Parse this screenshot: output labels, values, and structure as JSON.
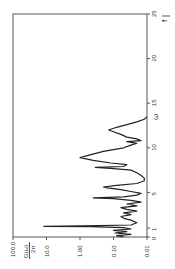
{
  "chart_data": {
    "type": "line",
    "title": "",
    "orientation": "rotated-90-ccw",
    "xlabel": "ω",
    "ylabel": "G(ω)/2π",
    "xscale": "linear",
    "yscale": "log",
    "xlim": [
      0,
      25
    ],
    "ylim": [
      0.01,
      100.0
    ],
    "x_ticks": [
      0,
      1,
      5,
      10,
      15,
      20,
      25
    ],
    "x_tick_labels": [
      "0",
      "1",
      "5",
      "10",
      "15",
      "20",
      "25"
    ],
    "y_ticks": [
      100.0,
      10.0,
      1.0,
      0.1,
      0.01
    ],
    "y_tick_labels": [
      "100.0",
      "10.0",
      "1.00",
      "0.10",
      "0.01"
    ],
    "ylabel_numerator": "G(ω)",
    "ylabel_denominator": "2π",
    "axis_arrow_label": "f",
    "grid": false,
    "legend": null,
    "series": [
      {
        "name": "G(ω)/2π",
        "x": [
          0.0,
          0.15,
          0.3,
          0.45,
          0.6,
          0.75,
          0.9,
          1.05,
          1.15,
          1.2,
          1.25,
          1.35,
          1.6,
          1.9,
          2.1,
          2.3,
          2.5,
          2.7,
          2.9,
          3.1,
          3.3,
          3.5,
          3.7,
          3.9,
          4.1,
          4.3,
          4.4,
          4.5,
          4.7,
          4.9,
          5.1,
          5.3,
          5.5,
          5.6,
          5.8,
          6.0,
          6.3,
          6.6,
          6.9,
          7.2,
          7.5,
          7.7,
          7.8,
          7.9,
          8.1,
          8.3,
          8.6,
          8.9,
          9.2,
          9.6,
          10.0,
          10.3,
          10.5,
          10.7,
          10.8,
          11.0,
          11.2,
          11.5,
          11.8,
          12.0,
          12.3,
          12.6,
          12.9,
          13.2,
          13.5
        ],
        "y": [
          0.05,
          0.08,
          0.03,
          0.09,
          0.04,
          0.1,
          0.03,
          0.05,
          0.5,
          12.0,
          0.8,
          0.03,
          0.02,
          0.03,
          0.05,
          0.06,
          0.03,
          0.05,
          0.02,
          0.04,
          0.06,
          0.02,
          0.04,
          0.015,
          0.03,
          0.1,
          0.4,
          0.05,
          0.02,
          0.015,
          0.03,
          0.06,
          0.15,
          0.2,
          0.08,
          0.02,
          0.012,
          0.012,
          0.015,
          0.02,
          0.03,
          0.12,
          0.35,
          0.05,
          0.04,
          0.12,
          0.4,
          1.0,
          0.5,
          0.2,
          0.05,
          0.03,
          0.02,
          0.04,
          0.015,
          0.02,
          0.04,
          0.06,
          0.1,
          0.14,
          0.08,
          0.04,
          0.02,
          0.012,
          0.01
        ]
      }
    ],
    "layout": {
      "plot_left": 13,
      "plot_right": 147,
      "plot_top": 14,
      "plot_bottom": 237,
      "omega_at_bottom": 0,
      "omega_at_top": 25,
      "log_at_left": 2,
      "log_at_right": -2
    }
  }
}
